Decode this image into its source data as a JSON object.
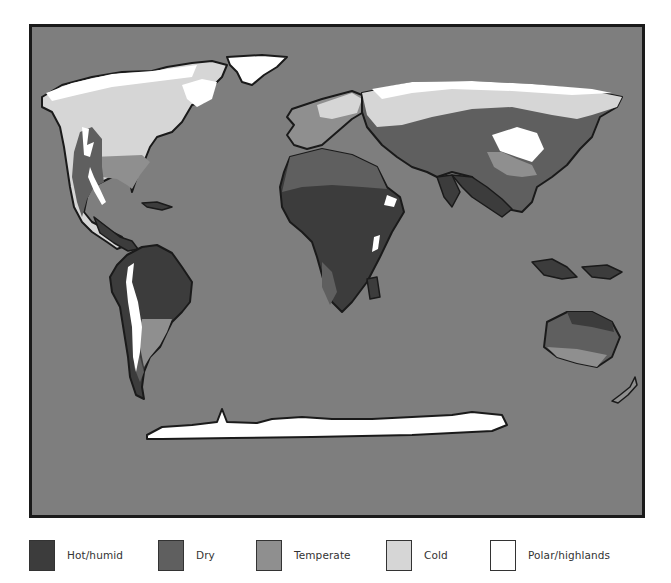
{
  "map": {
    "title": "World climate zones",
    "background_color": "#7e7e7e",
    "border_color": "#1a1a1a",
    "zone_colors": {
      "hot_humid": "#3c3c3c",
      "dry": "#5f5f5f",
      "temperate": "#8f8f8f",
      "cold": "#d6d6d6",
      "polar_highlands": "#ffffff"
    },
    "regions": [
      "North America",
      "South America",
      "Europe",
      "Africa",
      "Asia",
      "Australia",
      "Antarctica",
      "Greenland",
      "New Zealand",
      "Indonesia"
    ]
  },
  "legend": {
    "items": [
      {
        "label": "Hot/humid",
        "color": "#3c3c3c"
      },
      {
        "label": "Dry",
        "color": "#5f5f5f"
      },
      {
        "label": "Temperate",
        "color": "#8f8f8f"
      },
      {
        "label": "Cold",
        "color": "#d6d6d6"
      },
      {
        "label": "Polar/highlands",
        "color": "#ffffff"
      }
    ]
  }
}
